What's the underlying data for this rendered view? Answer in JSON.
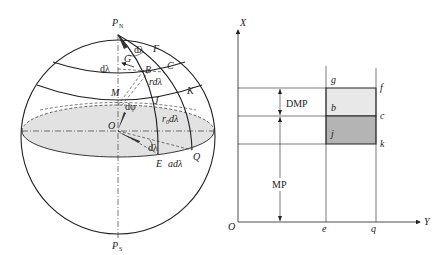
{
  "sphere": {
    "labels": {
      "north_pole": "P",
      "north_pole_sub": "N",
      "south_pole": "P",
      "south_pole_sub": "S",
      "F": "F",
      "G": "G",
      "B": "B",
      "C": "C",
      "K": "K",
      "J": "J",
      "M": "M",
      "O": "O",
      "E": "E",
      "Q": "Q",
      "d_lambda_left": "dλ",
      "d_lambda_top": "dλ",
      "r_d_lambda": "rdλ",
      "d_phi": "dφ",
      "r0_d_lambda": "r",
      "r0_sub": "0",
      "r0_suffix": "dλ",
      "d_lambda_bottom": "dλ",
      "a_d_lambda": "adλ"
    },
    "colors": {
      "equator_fill": "#e2e2e2",
      "line": "#222222"
    }
  },
  "chart": {
    "x_axis_label": "X",
    "y_axis_label": "Y",
    "origin_label": "O",
    "tick_e": "e",
    "tick_q": "q",
    "corner_g": "g",
    "corner_f": "f",
    "corner_b": "b",
    "corner_c": "c",
    "corner_j": "j",
    "corner_k": "k",
    "dmp_label": "DMP",
    "mp_label": "MP",
    "colors": {
      "upper_cell": "#e8e8e8",
      "lower_cell": "#b4b4b4"
    }
  }
}
